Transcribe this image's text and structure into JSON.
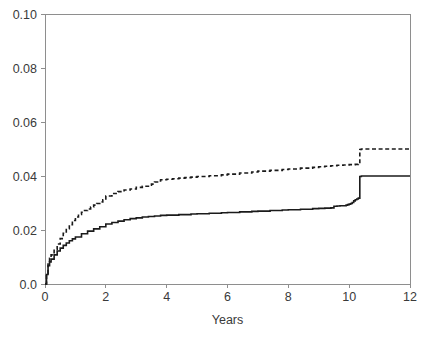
{
  "chart_data": {
    "type": "line",
    "title": "",
    "subtitle": "",
    "xlabel": "Years",
    "ylabel": "",
    "xlim": [
      0,
      12
    ],
    "ylim": [
      0.0,
      0.1
    ],
    "grid": false,
    "legend_position": "none",
    "xticks": [
      "0",
      "2",
      "4",
      "6",
      "8",
      "10",
      "12"
    ],
    "xtick_values": [
      0,
      2,
      4,
      6,
      8,
      10,
      12
    ],
    "yticks": [
      "0.0",
      "0.02",
      "0.04",
      "0.06",
      "0.08",
      "0.10"
    ],
    "ytick_values": [
      0.0,
      0.02,
      0.04,
      0.06,
      0.08,
      0.1
    ],
    "annotations": [],
    "series": [
      {
        "name": "upper-curve",
        "style": "dashed",
        "color": "#1b1b1b",
        "x": [
          0,
          0.05,
          0.1,
          0.15,
          0.2,
          0.3,
          0.4,
          0.5,
          0.6,
          0.7,
          0.8,
          0.9,
          1.0,
          1.1,
          1.2,
          1.3,
          1.4,
          1.5,
          1.6,
          1.7,
          1.8,
          1.9,
          2.0,
          2.2,
          2.4,
          2.6,
          2.8,
          3.0,
          3.2,
          3.4,
          3.5,
          3.6,
          3.7,
          3.8,
          4.0,
          4.2,
          4.4,
          4.6,
          4.8,
          5.0,
          5.4,
          5.8,
          6.0,
          6.4,
          6.8,
          7.0,
          7.4,
          7.8,
          8.0,
          8.4,
          8.8,
          9.0,
          9.2,
          9.4,
          9.6,
          9.8,
          10.0,
          10.2,
          10.3,
          10.35,
          10.4,
          11.0,
          11.5,
          12.0
        ],
        "y": [
          0.0,
          0.004,
          0.0078,
          0.0095,
          0.0108,
          0.0128,
          0.0148,
          0.0168,
          0.0188,
          0.0205,
          0.022,
          0.0235,
          0.0248,
          0.0258,
          0.0266,
          0.0272,
          0.0278,
          0.0285,
          0.0292,
          0.0298,
          0.0304,
          0.0312,
          0.0326,
          0.0335,
          0.0342,
          0.0348,
          0.0352,
          0.0358,
          0.0362,
          0.0366,
          0.037,
          0.0378,
          0.0382,
          0.0386,
          0.0388,
          0.039,
          0.0392,
          0.0394,
          0.0396,
          0.0398,
          0.0401,
          0.0404,
          0.0407,
          0.0411,
          0.0415,
          0.0418,
          0.0421,
          0.0424,
          0.0426,
          0.0429,
          0.0432,
          0.0434,
          0.0436,
          0.0438,
          0.044,
          0.0441,
          0.0442,
          0.0443,
          0.0444,
          0.0498,
          0.05,
          0.05,
          0.05,
          0.05
        ]
      },
      {
        "name": "lower-curve",
        "style": "solid",
        "color": "#1b1b1b",
        "x": [
          0,
          0.05,
          0.1,
          0.15,
          0.2,
          0.3,
          0.4,
          0.5,
          0.6,
          0.7,
          0.8,
          0.9,
          1.0,
          1.2,
          1.4,
          1.6,
          1.8,
          2.0,
          2.2,
          2.4,
          2.6,
          2.8,
          3.0,
          3.2,
          3.4,
          3.6,
          3.8,
          4.0,
          4.4,
          4.8,
          5.0,
          5.4,
          5.8,
          6.0,
          6.4,
          6.8,
          7.0,
          7.4,
          7.8,
          8.0,
          8.4,
          8.8,
          9.0,
          9.2,
          9.4,
          9.5,
          9.6,
          9.7,
          9.8,
          9.9,
          9.95,
          10.0,
          10.05,
          10.1,
          10.15,
          10.2,
          10.25,
          10.3,
          10.35,
          10.4,
          11.0,
          11.5,
          12.0
        ],
        "y": [
          0.0,
          0.0035,
          0.0068,
          0.0082,
          0.0092,
          0.0108,
          0.0122,
          0.0133,
          0.0143,
          0.0152,
          0.016,
          0.0167,
          0.0174,
          0.0186,
          0.0196,
          0.0204,
          0.0212,
          0.0222,
          0.0228,
          0.0233,
          0.0238,
          0.0242,
          0.0245,
          0.0248,
          0.025,
          0.0252,
          0.0254,
          0.0255,
          0.0257,
          0.0259,
          0.026,
          0.0262,
          0.0264,
          0.0265,
          0.0267,
          0.0269,
          0.027,
          0.0272,
          0.0274,
          0.0275,
          0.0277,
          0.0279,
          0.028,
          0.0281,
          0.0282,
          0.0288,
          0.0289,
          0.029,
          0.029,
          0.0292,
          0.0294,
          0.0296,
          0.0298,
          0.0302,
          0.0308,
          0.0312,
          0.0315,
          0.0318,
          0.0398,
          0.04,
          0.04,
          0.04,
          0.04
        ]
      }
    ]
  },
  "layout": {
    "plot_left": 45,
    "plot_right": 410,
    "plot_top": 14,
    "plot_bottom": 284
  }
}
